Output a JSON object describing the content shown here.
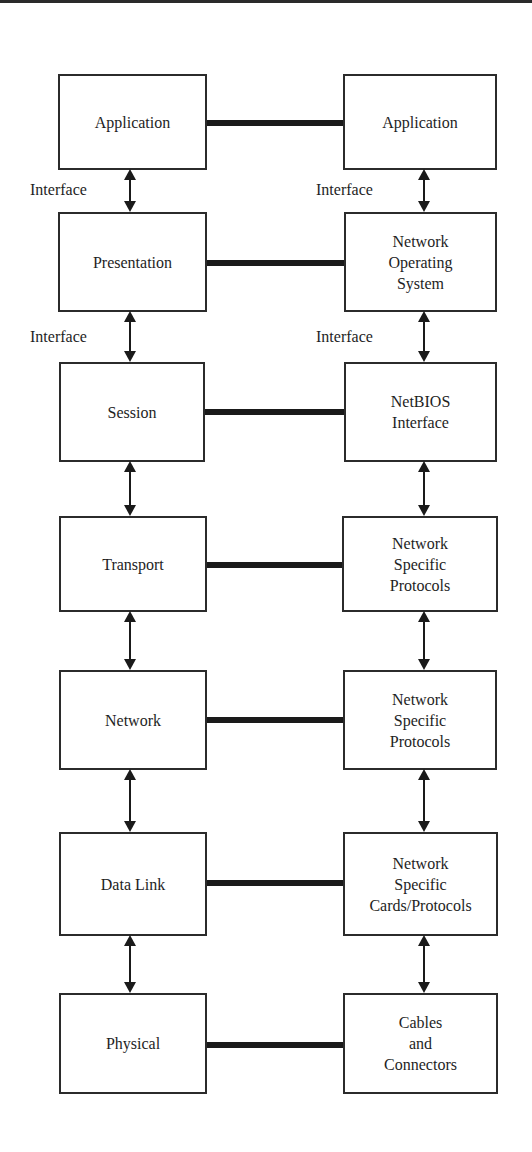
{
  "diagram": {
    "type": "layered-protocol-comparison",
    "left_column": {
      "layers": [
        {
          "label": "Application"
        },
        {
          "label": "Presentation"
        },
        {
          "label": "Session"
        },
        {
          "label": "Transport"
        },
        {
          "label": "Network"
        },
        {
          "label": "Data Link"
        },
        {
          "label": "Physical"
        }
      ],
      "interface_labels": [
        "Interface",
        "Interface"
      ]
    },
    "right_column": {
      "layers": [
        {
          "label": "Application"
        },
        {
          "label": "Network\nOperating\nSystem"
        },
        {
          "label": "NetBIOS\nInterface"
        },
        {
          "label": "Network\nSpecific\nProtocols"
        },
        {
          "label": "Network\nSpecific\nProtocols"
        },
        {
          "label": "Network\nSpecific\nCards/Protocols"
        },
        {
          "label": "Cables\nand\nConnectors"
        }
      ],
      "interface_labels": [
        "Interface",
        "Interface"
      ]
    },
    "connections": {
      "peer_links": 7,
      "vertical_bidirectional_arrows_per_column": 6
    },
    "colors": {
      "line": "#1a1a1a",
      "box_border": "#2b2b2b",
      "text": "#1e1e1e",
      "background": "#ffffff"
    }
  }
}
